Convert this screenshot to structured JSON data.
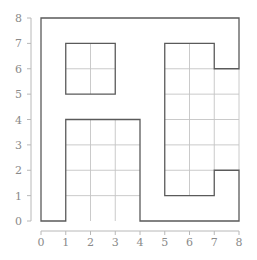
{
  "diagram": {
    "type": "grid-region",
    "x_axis": {
      "min": 0,
      "max": 8,
      "ticks": [
        "0",
        "1",
        "2",
        "3",
        "4",
        "5",
        "6",
        "7",
        "8"
      ]
    },
    "y_axis": {
      "min": 0,
      "max": 8,
      "ticks": [
        "0",
        "1",
        "2",
        "3",
        "4",
        "5",
        "6",
        "7",
        "8"
      ]
    },
    "outline_polygons": [
      {
        "name": "outer-boundary",
        "points": [
          [
            0,
            0
          ],
          [
            1,
            0
          ],
          [
            1,
            4
          ],
          [
            4,
            4
          ],
          [
            4,
            0
          ],
          [
            8,
            0
          ],
          [
            8,
            2
          ],
          [
            7,
            2
          ],
          [
            7,
            1
          ],
          [
            5,
            1
          ],
          [
            5,
            7
          ],
          [
            7,
            7
          ],
          [
            7,
            6
          ],
          [
            8,
            6
          ],
          [
            8,
            8
          ],
          [
            0,
            8
          ]
        ]
      },
      {
        "name": "square-block",
        "points": [
          [
            1,
            5
          ],
          [
            3,
            5
          ],
          [
            3,
            7
          ],
          [
            1,
            7
          ]
        ]
      }
    ],
    "grid_segments": [
      [
        [
          2,
          5
        ],
        [
          2,
          7
        ]
      ],
      [
        [
          1,
          6
        ],
        [
          3,
          6
        ]
      ],
      [
        [
          2,
          0
        ],
        [
          2,
          4
        ]
      ],
      [
        [
          3,
          0
        ],
        [
          3,
          4
        ]
      ],
      [
        [
          1,
          1
        ],
        [
          4,
          1
        ]
      ],
      [
        [
          1,
          2
        ],
        [
          4,
          2
        ]
      ],
      [
        [
          1,
          3
        ],
        [
          4,
          3
        ]
      ],
      [
        [
          6,
          1
        ],
        [
          6,
          7
        ]
      ],
      [
        [
          7,
          2
        ],
        [
          7,
          6
        ]
      ],
      [
        [
          8,
          2
        ],
        [
          8,
          6
        ]
      ],
      [
        [
          5,
          2
        ],
        [
          7,
          2
        ]
      ],
      [
        [
          5,
          3
        ],
        [
          8,
          3
        ]
      ],
      [
        [
          5,
          4
        ],
        [
          8,
          4
        ]
      ],
      [
        [
          5,
          5
        ],
        [
          8,
          5
        ]
      ],
      [
        [
          5,
          6
        ],
        [
          7,
          6
        ]
      ]
    ],
    "colors": {
      "outline": "#5a5a5a",
      "grid": "#c4c4c4",
      "axis": "#b8b8b8",
      "label": "#8a8a8a"
    }
  }
}
